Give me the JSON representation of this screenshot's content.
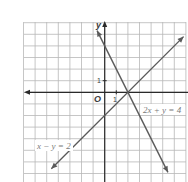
{
  "chart_data": {
    "type": "line",
    "title": "",
    "xlabel": "",
    "ylabel": "y",
    "origin_label": "O",
    "x_tick_label": "1",
    "y_tick_label": "1",
    "grid": true,
    "xlim": [
      -7,
      7
    ],
    "ylim": [
      -7.6,
      6
    ],
    "series": [
      {
        "name": "2x + y = 4",
        "equation": "2x + y = 4",
        "points": [
          [
            -0.66,
            5.32
          ],
          [
            5.45,
            -6.9
          ]
        ]
      },
      {
        "name": "x − y = 2",
        "equation": "x − y = 2",
        "points": [
          [
            -4.6,
            -6.6
          ],
          [
            6.8,
            4.8
          ]
        ]
      }
    ],
    "intersection": [
      2,
      0
    ]
  },
  "labels": {
    "y_axis": "y",
    "origin": "O",
    "x_one": "1",
    "y_one": "1",
    "eq1": "2x + y = 4",
    "eq2": "x − y = 2"
  },
  "colors": {
    "grid": "#b8b8b8",
    "axis": "#2a2a2a",
    "line": "#5a5a5a",
    "label_box": "#ffffff"
  }
}
